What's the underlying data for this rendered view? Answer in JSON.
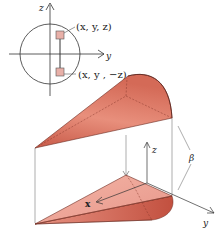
{
  "figure": {
    "top_inset": {
      "axis_z_label": "z",
      "axis_y_label": "y",
      "point_upper_label": "(x, y, z)",
      "point_lower_label": "(x, y , −z)"
    },
    "main": {
      "axis_z_label": "z",
      "axis_x_label": "x",
      "axis_y_label": "y",
      "angle_label": "β"
    },
    "colors": {
      "cone_fill": "#d9705e",
      "cone_light": "#f2b3a5",
      "cone_dark": "#b9483a",
      "marker_fill": "#e8b0a8",
      "line": "#333333",
      "guide": "#888888"
    }
  }
}
